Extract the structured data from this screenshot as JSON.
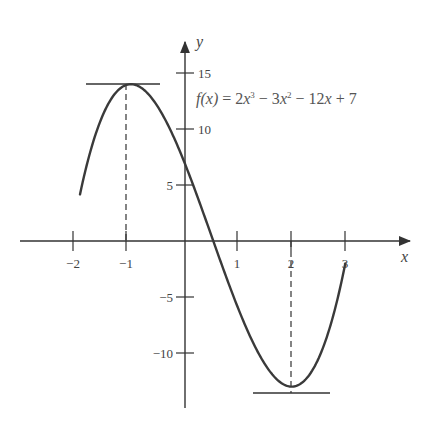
{
  "chart_data": {
    "type": "line",
    "title": "",
    "function_label": "f(x) = 2x³ − 3x² − 12x + 7",
    "function": {
      "name": "f",
      "expression": "2x^3 - 3x^2 - 12x + 7"
    },
    "xlabel": "x",
    "ylabel": "y",
    "xlim": [
      -2,
      3
    ],
    "ylim": [
      -13,
      15
    ],
    "x_ticks": [
      -2,
      -1,
      1,
      2,
      3
    ],
    "x_tick_labels": [
      "−2",
      "−1",
      "1",
      "2",
      "3"
    ],
    "y_ticks": [
      15,
      10,
      5,
      -5,
      -10
    ],
    "y_tick_labels": [
      "15",
      "10",
      "5",
      "−5",
      "−10"
    ],
    "grid": false,
    "legend": null,
    "series": [
      {
        "name": "f(x)",
        "domain": [
          -1.95,
          3
        ],
        "x": [
          -1.95,
          -1.5,
          -1,
          -0.5,
          0,
          0.5,
          1,
          1.5,
          2,
          2.5,
          3
        ],
        "values": [
          4.2,
          11.5,
          14,
          12,
          7,
          0.5,
          -6,
          -11,
          -13,
          -11.5,
          -2
        ]
      }
    ],
    "annotations": [
      {
        "type": "horizontal-tangent",
        "label": "local maximum",
        "x": -1,
        "y": 14,
        "dashed_drop_line": true
      },
      {
        "type": "horizontal-tangent",
        "label": "local minimum",
        "x": 2,
        "y": -13,
        "dashed_drop_line": true
      }
    ]
  },
  "labels": {
    "x_axis": "x",
    "y_axis": "y",
    "formula": {
      "lhs": "f(x)",
      "eq": " = 2",
      "x1": "x",
      "p1": "3",
      "m1": " − 3",
      "x2": "x",
      "p2": "2",
      "m2": " − 12",
      "x3": "x",
      "tail": " + 7"
    }
  },
  "ticks": {
    "x": [
      "−2",
      "−1",
      "1",
      "2",
      "3"
    ],
    "y": [
      "15",
      "10",
      "5",
      "−5",
      "−10"
    ]
  },
  "colors": {
    "axis": "#333333",
    "curve": "#3a3a3a",
    "text": "#444444"
  }
}
